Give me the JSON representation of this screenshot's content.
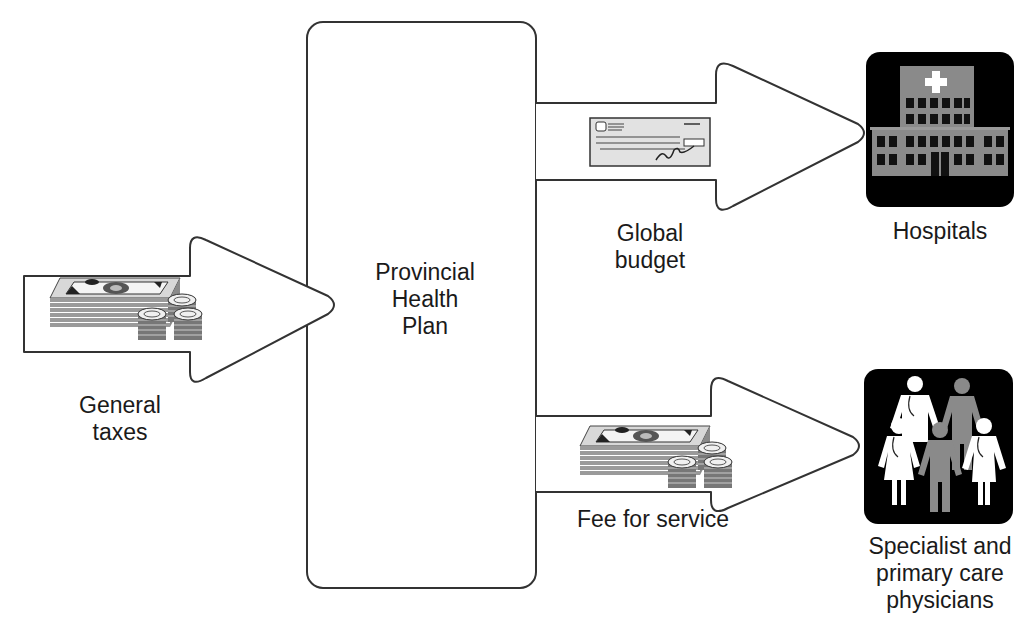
{
  "diagram": {
    "type": "flow",
    "center_node": {
      "label": "Provincial\nHealth\nPlan"
    },
    "source": {
      "label": "General\ntaxes",
      "icon": "money-stack-coins-icon"
    },
    "flows": [
      {
        "label": "Global\nbudget",
        "payment_icon": "cheque-icon",
        "target": "Hospitals",
        "target_icon": "hospital-icon"
      },
      {
        "label": "Fee for service",
        "payment_icon": "money-stack-coins-icon",
        "target": "Specialist and\nprimary care\nphysicians",
        "target_icon": "physicians-group-icon"
      }
    ],
    "colors": {
      "stroke": "#333333",
      "icon_bg": "#000000",
      "icon_gray": "#8a8a8a",
      "icon_white": "#ffffff",
      "money": "#bdbdbd"
    }
  }
}
